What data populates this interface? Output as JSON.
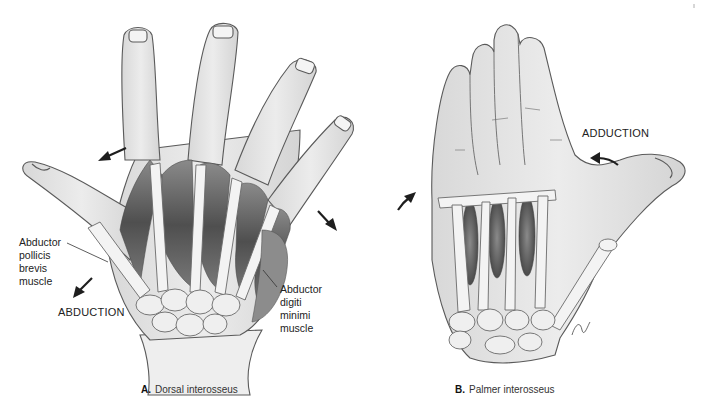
{
  "figure": {
    "panel_a": {
      "letter": "A.",
      "title": "Dorsal interosseus",
      "labels": {
        "apb_line1": "Abductor",
        "apb_line2": "pollicis",
        "apb_line3": "brevis",
        "apb_line4": "muscle",
        "adm_line1": "Abductor",
        "adm_line2": "digiti",
        "adm_line3": "minimi",
        "adm_line4": "muscle",
        "movement": "ABDUCTION"
      }
    },
    "panel_b": {
      "letter": "B.",
      "title": "Palmer interosseus",
      "labels": {
        "movement": "ADDUCTION"
      }
    },
    "colors": {
      "outline": "#5a5a5a",
      "skin": "#e6e6e6",
      "bone": "#f2f2f2",
      "muscle": "#6e6e6e",
      "arrow": "#1e1e1e"
    }
  }
}
